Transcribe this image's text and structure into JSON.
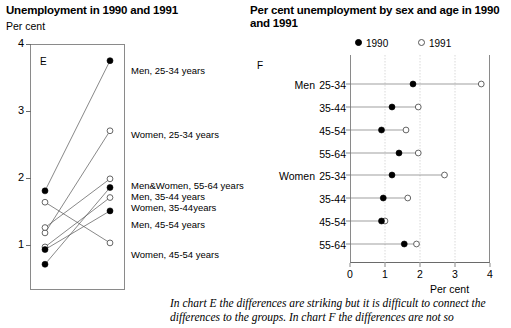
{
  "chart_e": {
    "title": "Unemployment in 1990 and 1991",
    "unit_label": "Per cent",
    "panel_letter": "E",
    "y_ticks": [
      "4",
      "3",
      "2",
      "1"
    ],
    "series_labels": [
      "Men, 25-34 years",
      "Women, 25-34 years",
      "Men&Women, 55-64 years",
      "Men, 35-44 years",
      "Women, 35-44years",
      "Men, 45-54 years",
      "Women, 45-54 years"
    ]
  },
  "chart_f": {
    "title": "Per cent unemployment by sex and age in 1990 and 1991",
    "panel_letter": "F",
    "legend": [
      {
        "marker": "filled-dot-icon",
        "label": "1990"
      },
      {
        "marker": "open-dot-icon",
        "label": "1991"
      }
    ],
    "group_labels": [
      "Men",
      "Women"
    ],
    "row_labels": [
      "25-34",
      "35-44",
      "45-54",
      "55-64",
      "25-34",
      "35-44",
      "45-54",
      "55-64"
    ],
    "x_ticks": [
      "0",
      "1",
      "2",
      "3",
      "4"
    ],
    "x_axis_title": "Per cent"
  },
  "caption": "In chart E the differences are striking but it is difficult to connect the differences to the groups. In chart F the differences are not so",
  "chart_data": [
    {
      "type": "line",
      "id": "chart-e",
      "title": "Unemployment in 1990 and 1991",
      "xlabel": "",
      "ylabel": "Per cent",
      "ylim": [
        0,
        4
      ],
      "grid": false,
      "legend_position": "right-labels",
      "x": [
        "1990",
        "1991"
      ],
      "series": [
        {
          "name": "Men, 25-34 years",
          "values": [
            1.8,
            3.75
          ],
          "marker_start": "filled",
          "marker_end": "filled"
        },
        {
          "name": "Women, 25-34 years",
          "values": [
            1.17,
            2.7
          ],
          "marker_start": "open",
          "marker_end": "open"
        },
        {
          "name": "Men&Women, 55-64 years",
          "values": [
            1.25,
            1.98
          ],
          "marker_start": "open",
          "marker_end": "open"
        },
        {
          "name": "Men, 35-44 years",
          "values": [
            0.7,
            1.85
          ],
          "marker_start": "filled",
          "marker_end": "filled"
        },
        {
          "name": "Women, 35-44years",
          "values": [
            0.96,
            1.7
          ],
          "marker_start": "open",
          "marker_end": "open"
        },
        {
          "name": "Men, 45-54 years",
          "values": [
            0.92,
            1.5
          ],
          "marker_start": "filled",
          "marker_end": "filled"
        },
        {
          "name": "Women, 45-54 years",
          "values": [
            1.63,
            1.02
          ],
          "marker_start": "open",
          "marker_end": "open"
        }
      ]
    },
    {
      "type": "scatter",
      "id": "chart-f",
      "title": "Per cent unemployment by sex and age in 1990 and 1991",
      "xlabel": "Per cent",
      "ylabel": "",
      "xlim": [
        0,
        4
      ],
      "grid": true,
      "legend_position": "top",
      "categories": [
        "Men 25-34",
        "Men 35-44",
        "Men 45-54",
        "Men 55-64",
        "Women 25-34",
        "Women 35-44",
        "Women 45-54",
        "Women 55-64"
      ],
      "series": [
        {
          "name": "1990",
          "marker": "filled",
          "values": [
            1.8,
            1.2,
            0.9,
            1.4,
            1.2,
            0.95,
            0.9,
            1.55
          ]
        },
        {
          "name": "1991",
          "marker": "open",
          "values": [
            3.75,
            1.95,
            1.6,
            1.95,
            2.7,
            1.65,
            1.0,
            1.9
          ]
        }
      ]
    }
  ]
}
